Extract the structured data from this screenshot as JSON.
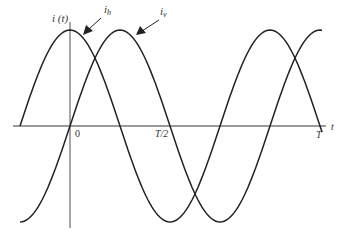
{
  "diagram": {
    "y_axis_label": "i (t)",
    "x_axis_label": "t",
    "tick_labels": {
      "origin": "0",
      "half_period": "T/2",
      "period": "T"
    },
    "curves": [
      {
        "name": "i_h",
        "label_base": "i",
        "label_sub": "h",
        "phase": "peak at t=0 (cosine)"
      },
      {
        "name": "i_v",
        "label_base": "i",
        "label_sub": "v",
        "phase": "lags i_h by quarter period (sine)"
      }
    ],
    "colors": {
      "curve": "#222222",
      "axis": "#777777",
      "text": "#333333"
    }
  }
}
